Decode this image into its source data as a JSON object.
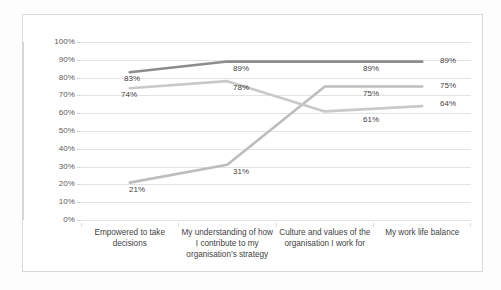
{
  "chart_data": {
    "type": "line",
    "title": "",
    "xlabel": "",
    "ylabel": "",
    "ylim": [
      0,
      100
    ],
    "grid": true,
    "legend": "none",
    "categories": [
      "Empowered to take decisions",
      "My understanding of how I contribute to my organisation's strategy",
      "Culture and values of the organisation I work for",
      "My work life balance"
    ],
    "ytick_labels": [
      "100%",
      "90%",
      "80%",
      "70%",
      "60%",
      "50%",
      "40%",
      "30%",
      "20%",
      "10%",
      "0%"
    ],
    "ytick_values": [
      100,
      90,
      80,
      70,
      60,
      50,
      40,
      30,
      20,
      10,
      0
    ],
    "series": [
      {
        "name": "series-1",
        "color": "#8c8c8c",
        "values": [
          83,
          89,
          89,
          89
        ],
        "labels": [
          "83%",
          "89%",
          "89%",
          "89%"
        ]
      },
      {
        "name": "series-2",
        "color": "#c9c9c9",
        "values": [
          74,
          78,
          61,
          64
        ],
        "labels": [
          "74%",
          "78%",
          "61%",
          "64%"
        ]
      },
      {
        "name": "series-3",
        "color": "#bdbdbd",
        "values": [
          21,
          31,
          75,
          75
        ],
        "labels": [
          "21%",
          "31%",
          "75%",
          "75%"
        ]
      }
    ]
  },
  "ylabels": {
    "t0": "100%",
    "t1": "90%",
    "t2": "80%",
    "t3": "70%",
    "t4": "60%",
    "t5": "50%",
    "t6": "40%",
    "t7": "30%",
    "t8": "20%",
    "t9": "10%",
    "t10": "0%"
  },
  "xlabels": {
    "c0": "Empowered to take decisions",
    "c1": "My understanding of how I contribute to my organisation’s strategy",
    "c2": "Culture and values of the organisation I work for",
    "c3": "My work life balance"
  },
  "datalabels": {
    "s1p0": "83%",
    "s1p1": "89%",
    "s1p2": "89%",
    "s1p3": "89%",
    "s2p0": "74%",
    "s2p1": "78%",
    "s2p2": "61%",
    "s2p3": "64%",
    "s3p0": "21%",
    "s3p1": "31%",
    "s3p2": "75%",
    "s3p3": "75%"
  },
  "colors": {
    "series1": "#8c8c8c",
    "series2": "#c9c9c9",
    "series3": "#bdbdbd",
    "grid": "#e3e3e3",
    "frame": "#d9d9d9",
    "text": "#3f3f3f"
  }
}
